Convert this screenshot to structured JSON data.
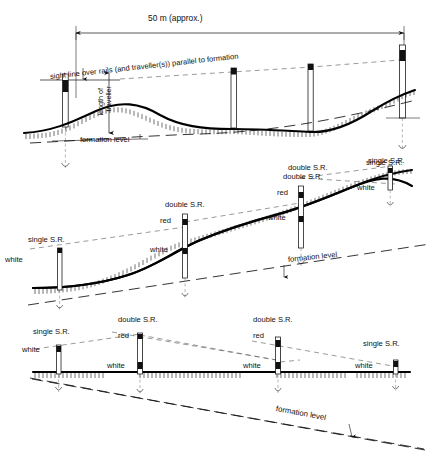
{
  "figure": {
    "type": "engineering-diagram"
  },
  "panels": [
    {
      "id": "panel-top",
      "name": "undulating-formation-panel",
      "dimension": {
        "label": "50 m (approx.)"
      },
      "annotations": {
        "sight_line": "sight line over rails (and traveller(s)) parallel to formation",
        "traveller_length_line1": "length of",
        "traveller_length_line2": "traveller",
        "formation_level": "formation level"
      },
      "stake_captions": [
        {
          "label": "double S.R."
        },
        {
          "label": "single S.R."
        }
      ]
    },
    {
      "id": "panel-middle",
      "name": "rising-gradient-panel",
      "annotations": {
        "formation_level": "formation level"
      },
      "stakes": [
        {
          "type": "single S.R.",
          "caption": "single S.R.",
          "bands": [
            {
              "label": "white"
            }
          ]
        },
        {
          "type": "double S.R.",
          "caption": "double S.R.",
          "bands": [
            {
              "label": "red"
            },
            {
              "label": "white"
            }
          ]
        },
        {
          "type": "double S.R.",
          "caption": "double S.R.",
          "bands": [
            {
              "label": "red"
            },
            {
              "label": "white"
            }
          ]
        },
        {
          "type": "single S.R.",
          "caption": "single S.R.",
          "bands": [
            {
              "label": "white"
            }
          ]
        }
      ]
    },
    {
      "id": "panel-bottom",
      "name": "falling-gradient-panel",
      "annotations": {
        "formation_level": "formation level"
      },
      "stakes": [
        {
          "type": "single S.R.",
          "caption": "single S.R.",
          "bands": [
            {
              "label": "white"
            }
          ]
        },
        {
          "type": "double S.R.",
          "caption": "double S.R.",
          "bands": [
            {
              "label": "red"
            },
            {
              "label": "white"
            }
          ]
        },
        {
          "type": "double S.R.",
          "caption": "double S.R.",
          "bands": [
            {
              "label": "red"
            },
            {
              "label": "white"
            }
          ]
        },
        {
          "type": "single S.R.",
          "caption": "single S.R.",
          "bands": [
            {
              "label": "white"
            }
          ]
        }
      ]
    }
  ],
  "labels": {
    "dim_50m": "50 m (approx.)",
    "sight_line": "sight line over rails (and traveller(s)) parallel to formation",
    "length_of": "length of",
    "traveller": "traveller",
    "formation_level": "formation level",
    "single_sr": "single S.R.",
    "double_sr": "double S.R.",
    "white": "white",
    "red": "red"
  },
  "colors": {
    "ink": "#111111",
    "rail": "#000000",
    "paper": "#ffffff",
    "dashed_grey": "#888888"
  }
}
